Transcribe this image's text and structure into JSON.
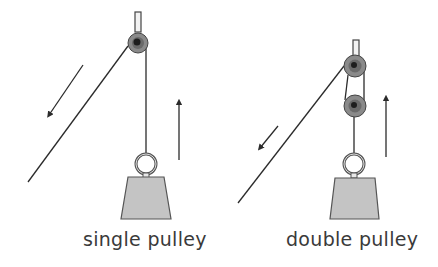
{
  "diagram": {
    "panels": [
      {
        "id": "single",
        "label": "single pulley",
        "pulley_count": 1
      },
      {
        "id": "double",
        "label": "double pulley",
        "pulley_count": 2
      }
    ],
    "colors": {
      "line": "#2b2b2b",
      "pulley_outer": "#8a8a8a",
      "pulley_inner": "#2a2a2a",
      "weight_fill": "#c4c4c4",
      "weight_stroke": "#555555",
      "text": "#3a3a3a"
    },
    "arrows": [
      {
        "panel": "single",
        "direction": "down-left",
        "meaning": "pull-effort"
      },
      {
        "panel": "single",
        "direction": "up",
        "meaning": "load-movement"
      },
      {
        "panel": "double",
        "direction": "down-left",
        "meaning": "pull-effort"
      },
      {
        "panel": "double",
        "direction": "up",
        "meaning": "load-movement"
      }
    ]
  }
}
